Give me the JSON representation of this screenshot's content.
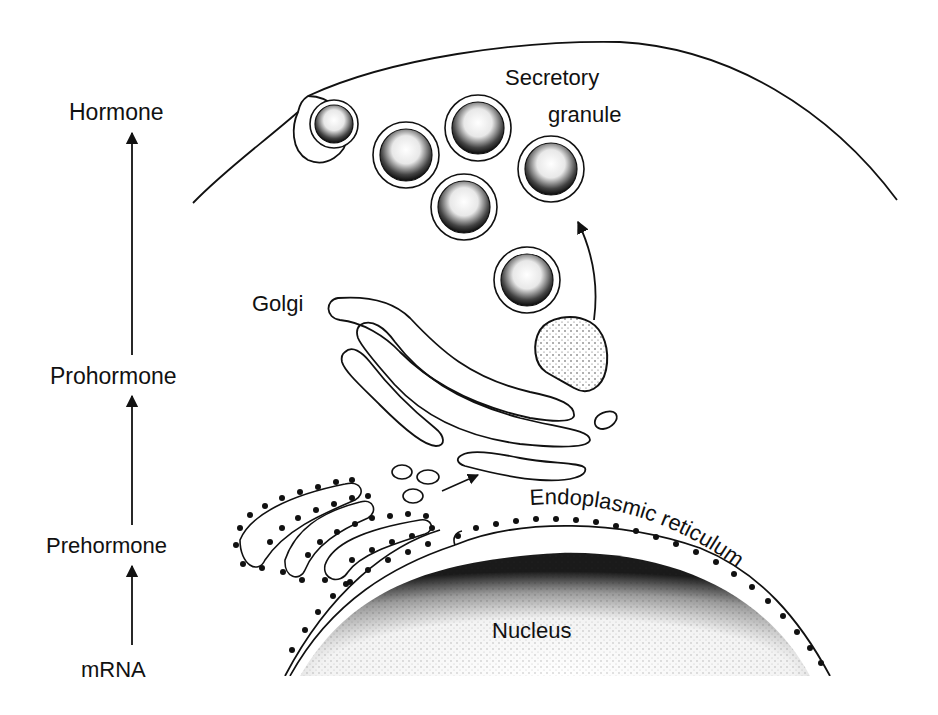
{
  "diagram": {
    "pathway_labels": [
      {
        "id": "hormone",
        "text": "Hormone"
      },
      {
        "id": "prohormone",
        "text": "Prohormone"
      },
      {
        "id": "prehormone",
        "text": "Prehormone"
      },
      {
        "id": "mrna",
        "text": "mRNA"
      }
    ],
    "organelle_labels": {
      "secretory_line1": "Secretory",
      "secretory_line2": "granule",
      "golgi": "Golgi",
      "er": "Endoplasmic reticulum",
      "nucleus": "Nucleus"
    },
    "colors": {
      "ink": "#111111",
      "background": "#ffffff"
    }
  }
}
